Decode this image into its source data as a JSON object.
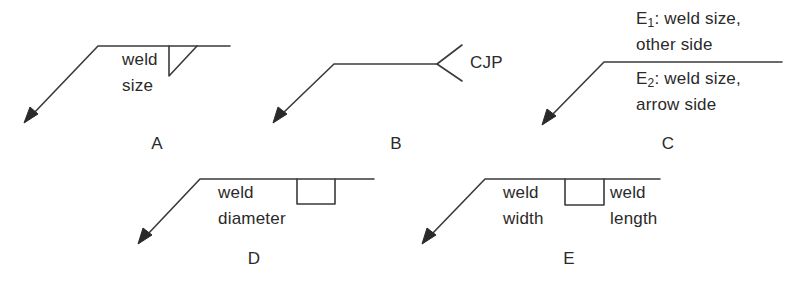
{
  "figure": {
    "panels": [
      {
        "id": "A",
        "label": "A",
        "symbol": "fillet-weld",
        "texts": {
          "line1": "weld",
          "line2": "size"
        }
      },
      {
        "id": "B",
        "label": "B",
        "symbol": "complete-joint-penetration-tail",
        "texts": {
          "tail": "CJP"
        }
      },
      {
        "id": "C",
        "label": "C",
        "symbol": "both-sides-reference",
        "texts": {
          "other_prefix": "E",
          "other_sub": "1",
          "other_line1_rest": ": weld size,",
          "other_line2": "other side",
          "arrow_prefix": "E",
          "arrow_sub": "2",
          "arrow_line1_rest": ": weld size,",
          "arrow_line2": "arrow side"
        }
      },
      {
        "id": "D",
        "label": "D",
        "symbol": "plug-weld",
        "texts": {
          "line1": "weld",
          "line2": "diameter"
        }
      },
      {
        "id": "E",
        "label": "E",
        "symbol": "slot-weld",
        "texts": {
          "left_line1": "weld",
          "left_line2": "width",
          "right_line1": "weld",
          "right_line2": "length"
        }
      }
    ]
  }
}
